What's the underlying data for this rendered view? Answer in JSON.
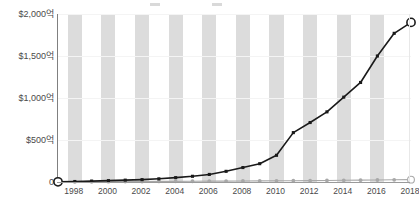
{
  "chart_data": {
    "type": "line",
    "title": "",
    "subtitle": "",
    "xlabel": "",
    "ylabel": "",
    "x": [
      1997,
      1998,
      1999,
      2000,
      2001,
      2002,
      2003,
      2004,
      2005,
      2006,
      2007,
      2008,
      2009,
      2010,
      2011,
      2012,
      2013,
      2014,
      2015,
      2016,
      2017,
      2018
    ],
    "xlim": [
      1997,
      2018
    ],
    "ylim": [
      0,
      2000
    ],
    "y_ticks": [
      0,
      500,
      1000,
      1500,
      2000
    ],
    "y_tick_labels": [
      "0",
      "$500억",
      "$1,000억",
      "$1,500억",
      "$2,000억"
    ],
    "x_tick_labels": [
      "1998",
      "2000",
      "2002",
      "2004",
      "2006",
      "2008",
      "2010",
      "2012",
      "2014",
      "2016",
      "2018"
    ],
    "x_ticks": [
      1998,
      2000,
      2002,
      2004,
      2006,
      2008,
      2010,
      2012,
      2014,
      2016,
      2018
    ],
    "grid": "horizontal",
    "legend_position": "top",
    "background_bands": "alternating-vertical-gray",
    "series": [
      {
        "name": "series-1",
        "color": "#1a1a1a",
        "marker": "square",
        "endpoint_marker": "open-circle",
        "values": [
          2,
          6,
          11,
          16,
          22,
          28,
          38,
          52,
          68,
          90,
          127,
          172,
          218,
          318,
          588,
          708,
          835,
          1010,
          1185,
          1500,
          1770,
          1900
        ]
      },
      {
        "name": "series-2",
        "color": "#a8a8a8",
        "marker": "circle",
        "endpoint_marker": "open-circle",
        "values": [
          1,
          2,
          3,
          4,
          5,
          6,
          7,
          8,
          9,
          10,
          11,
          12,
          13,
          14,
          15,
          16,
          18,
          20,
          22,
          24,
          26,
          28
        ]
      }
    ]
  },
  "legend": {
    "entries": [
      {
        "label": "",
        "color": "#d9d9d9"
      },
      {
        "label": "",
        "color": "#d9d9d9"
      }
    ]
  },
  "colors": {
    "series_1": "#1a1a1a",
    "series_2": "#a8a8a8",
    "band": "#dcdcdc",
    "gridline": "#f4f4f4",
    "axis": "#808080",
    "tick_text": "#4a4a4a",
    "plot_background": "#ffffff"
  }
}
